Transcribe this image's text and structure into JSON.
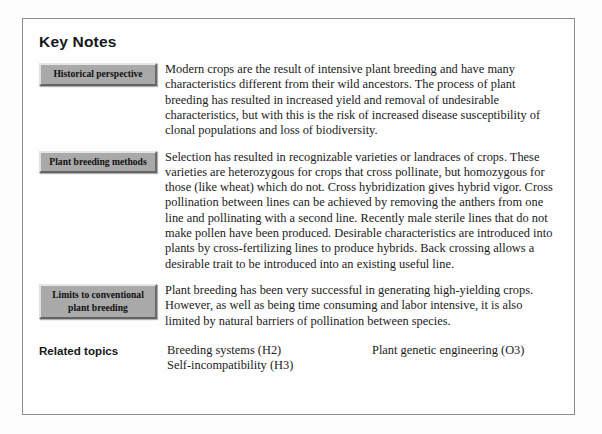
{
  "page": {
    "title": "Key Notes",
    "frame_color": "#8d8d8d",
    "background_color": "#fdfdfd",
    "label_box_color": "#a9a9a9",
    "text_color": "#1b1b1b"
  },
  "notes": [
    {
      "label": "Historical perspective",
      "body": "Modern crops are the result of intensive plant breeding and have many characteristics different from their wild ancestors. The process of plant breeding has resulted in increased yield and removal of undesirable characteristics, but with this is the risk of increased disease susceptibility of clonal populations and loss of biodiversity."
    },
    {
      "label": "Plant breeding methods",
      "body": "Selection has resulted in recognizable varieties or landraces of crops. These varieties are heterozygous for crops that cross pollinate, but homozygous for those (like wheat) which do not. Cross hybridization gives hybrid vigor. Cross pollination between lines can be achieved by removing the anthers from one line and pollinating with a second line. Recently male sterile lines that do not make pollen have been produced. Desirable characteristics are introduced into plants by cross-fertilizing lines to produce hybrids. Back crossing allows a desirable trait to be introduced into an existing useful line."
    },
    {
      "label": "Limits to conventional plant breeding",
      "body": "Plant breeding has been very successful in generating high-yielding crops. However, as well as being time consuming and labor intensive, it is also limited by natural barriers of pollination between species."
    }
  ],
  "related": {
    "label": "Related topics",
    "column_one": [
      "Breeding systems (H2)",
      "Self-incompatibility (H3)"
    ],
    "column_two": [
      "Plant genetic engineering (O3)"
    ]
  }
}
